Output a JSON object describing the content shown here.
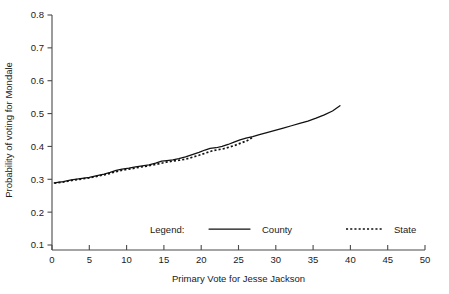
{
  "chart_data": {
    "type": "line",
    "title": "",
    "xlabel": "Primary Vote for Jesse Jackson",
    "ylabel": "Probability of voting for Mondale",
    "xlim": [
      0,
      50
    ],
    "ylim": [
      0.1,
      0.8
    ],
    "xticks": [
      0,
      5,
      10,
      15,
      20,
      25,
      30,
      35,
      40,
      45,
      50
    ],
    "xticklabels": [
      "0",
      "5",
      "10",
      "15",
      "20",
      "25",
      "30",
      "35",
      "40",
      "45",
      "50"
    ],
    "yticks": [
      0.1,
      0.2,
      0.3,
      0.4,
      0.5,
      0.6,
      0.7,
      0.8
    ],
    "yticklabels": [
      "0.1",
      "0.2",
      "0.3",
      "0.4",
      "0.5",
      "0.6",
      "0.7",
      "0.8"
    ],
    "grid": false,
    "legend_position": "inside-bottom-center",
    "legend_title": "Legend:",
    "series": [
      {
        "name": "County",
        "style": "solid",
        "color": "#111111",
        "x": [
          0.3,
          1.5,
          2.6,
          3.8,
          5.0,
          6.2,
          7.0,
          7.8,
          8.6,
          9.4,
          10.3,
          11.2,
          12.1,
          13.0,
          13.9,
          14.7,
          15.4,
          16.2,
          17.0,
          17.9,
          18.8,
          19.7,
          20.5,
          21.2,
          22.0,
          22.8,
          23.6,
          24.4,
          25.2,
          26.0,
          26.9,
          27.8,
          28.8,
          29.9,
          31.0,
          32.1,
          33.2,
          34.3,
          35.4,
          36.5,
          37.6,
          38.6
        ],
        "y": [
          0.289,
          0.293,
          0.298,
          0.302,
          0.306,
          0.312,
          0.316,
          0.321,
          0.327,
          0.331,
          0.334,
          0.338,
          0.341,
          0.344,
          0.349,
          0.355,
          0.357,
          0.359,
          0.363,
          0.368,
          0.375,
          0.382,
          0.389,
          0.394,
          0.396,
          0.4,
          0.406,
          0.413,
          0.42,
          0.425,
          0.43,
          0.436,
          0.442,
          0.449,
          0.456,
          0.463,
          0.47,
          0.477,
          0.486,
          0.496,
          0.508,
          0.524
        ]
      },
      {
        "name": "State",
        "style": "dotted",
        "color": "#111111",
        "x": [
          0.3,
          1.6,
          2.8,
          4.0,
          5.2,
          6.4,
          7.3,
          8.2,
          9.1,
          10.0,
          10.9,
          11.8,
          12.7,
          13.6,
          14.5,
          15.3,
          16.1,
          17.0,
          17.9,
          18.8,
          19.7,
          20.6,
          21.4,
          22.2,
          23.0,
          23.8,
          24.6,
          25.4,
          26.2,
          26.9
        ],
        "y": [
          0.288,
          0.292,
          0.297,
          0.301,
          0.305,
          0.311,
          0.315,
          0.321,
          0.326,
          0.33,
          0.333,
          0.337,
          0.34,
          0.344,
          0.348,
          0.352,
          0.355,
          0.358,
          0.361,
          0.367,
          0.373,
          0.38,
          0.386,
          0.39,
          0.393,
          0.398,
          0.404,
          0.411,
          0.418,
          0.428
        ]
      }
    ]
  },
  "axes": {
    "y_label": "Probability of voting for Mondale",
    "x_label": "Primary Vote for Jesse Jackson"
  },
  "legend": {
    "label": "Legend:",
    "county_label": "County",
    "state_label": "State"
  },
  "colors": {
    "line": "#111111",
    "axis": "#4a4a4a",
    "background": "#ffffff"
  }
}
